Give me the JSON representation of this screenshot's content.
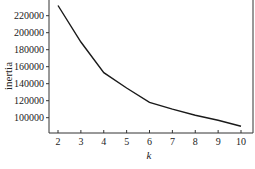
{
  "chart_data": {
    "type": "line",
    "title": "",
    "xlabel": "k",
    "ylabel": "inertia",
    "x": [
      2,
      3,
      4,
      5,
      6,
      7,
      8,
      9,
      10
    ],
    "series": [
      {
        "name": "inertia",
        "values": [
          232000,
          189000,
          153000,
          135000,
          118000,
          110000,
          103000,
          97000,
          90000
        ]
      }
    ],
    "xticks": [
      "2",
      "3",
      "4",
      "5",
      "6",
      "7",
      "8",
      "9",
      "10"
    ],
    "yticks": [
      "100000",
      "120000",
      "140000",
      "160000",
      "180000",
      "200000",
      "220000"
    ],
    "ytick_values": [
      100000,
      120000,
      140000,
      160000,
      180000,
      200000,
      220000
    ],
    "xlim": [
      1.8,
      10.5
    ],
    "ylim": [
      83000,
      238000
    ],
    "grid": false,
    "legend": null,
    "line_color": "#1a1a1a"
  }
}
